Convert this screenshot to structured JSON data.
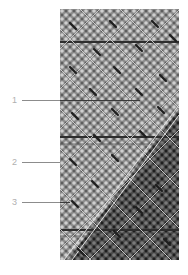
{
  "figure": {
    "colors": {
      "background": "#ffffff",
      "pattern_base": "#8a8a8a",
      "pattern_light": "#c8c8c8",
      "pattern_dark": "#3a3a3a",
      "band": "#2e2e2e",
      "dark_region": "#303030",
      "label_text": "#b0b0b0",
      "leader_line": "#8c8c8c"
    },
    "callouts": [
      {
        "id": "callout-1",
        "label": "1",
        "label_x": 13,
        "label_y": 96,
        "line_y": 100,
        "line_start_x": 22,
        "line_end_x": 140
      },
      {
        "id": "callout-2",
        "label": "2",
        "label_x": 13,
        "label_y": 158,
        "line_y": 162,
        "line_start_x": 22,
        "line_end_x": 60
      },
      {
        "id": "callout-3",
        "label": "3",
        "label_x": 13,
        "label_y": 198,
        "line_y": 202,
        "line_start_x": 22,
        "line_end_x": 70
      }
    ]
  }
}
